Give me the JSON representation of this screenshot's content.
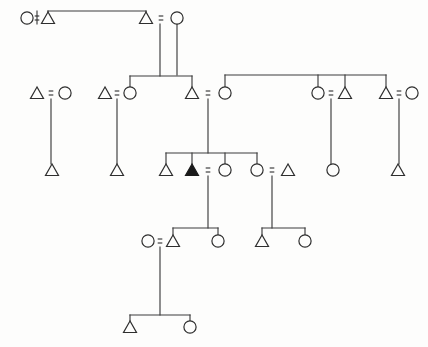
{
  "diagram": {
    "type": "kinship-genealogy-diagram",
    "background_color": "#fdfdfc",
    "line_color": "#3c3c3c",
    "symbol_stroke_color": "#2e2e2e",
    "ego_fill_color": "#1a1a1a",
    "width": 428,
    "height": 347,
    "legend": {
      "triangle": "male",
      "circle": "female",
      "filled_triangle": "ego",
      "equals_sign": "marriage-union",
      "vertical_line": "descent",
      "horizontal_line": "sibling-link"
    },
    "generation_rows": [
      {
        "id": "g1",
        "label": "Generation 1",
        "y": 18
      },
      {
        "id": "g2",
        "label": "Generation 2",
        "y": 93
      },
      {
        "id": "g3",
        "label": "Generation 3",
        "y": 170
      },
      {
        "id": "g4",
        "label": "Generation 4",
        "y": 241
      },
      {
        "id": "g5",
        "label": "Generation 5",
        "y": 327
      }
    ],
    "persons": [
      {
        "id": "p1",
        "sex": "female",
        "generation": 1,
        "x": 27,
        "y": 18,
        "ego": false
      },
      {
        "id": "p2",
        "sex": "male",
        "generation": 1,
        "x": 48,
        "y": 18,
        "ego": false
      },
      {
        "id": "p3",
        "sex": "male",
        "generation": 1,
        "x": 146,
        "y": 18,
        "ego": false
      },
      {
        "id": "p4",
        "sex": "female",
        "generation": 1,
        "x": 177,
        "y": 18,
        "ego": false
      },
      {
        "id": "p5",
        "sex": "male",
        "generation": 2,
        "x": 37,
        "y": 93,
        "ego": false
      },
      {
        "id": "p6",
        "sex": "female",
        "generation": 2,
        "x": 65,
        "y": 93,
        "ego": false
      },
      {
        "id": "p7",
        "sex": "male",
        "generation": 2,
        "x": 105,
        "y": 93,
        "ego": false
      },
      {
        "id": "p8",
        "sex": "female",
        "generation": 2,
        "x": 130,
        "y": 93,
        "ego": false
      },
      {
        "id": "p9",
        "sex": "male",
        "generation": 2,
        "x": 192,
        "y": 93,
        "ego": false
      },
      {
        "id": "p10",
        "sex": "female",
        "generation": 2,
        "x": 225,
        "y": 93,
        "ego": false
      },
      {
        "id": "p11",
        "sex": "female",
        "generation": 2,
        "x": 318,
        "y": 93,
        "ego": false
      },
      {
        "id": "p12",
        "sex": "male",
        "generation": 2,
        "x": 345,
        "y": 93,
        "ego": false
      },
      {
        "id": "p13",
        "sex": "male",
        "generation": 2,
        "x": 386,
        "y": 93,
        "ego": false
      },
      {
        "id": "p14",
        "sex": "female",
        "generation": 2,
        "x": 412,
        "y": 93,
        "ego": false
      },
      {
        "id": "p15",
        "sex": "male",
        "generation": 3,
        "x": 52,
        "y": 170,
        "ego": false
      },
      {
        "id": "p16",
        "sex": "male",
        "generation": 3,
        "x": 117,
        "y": 170,
        "ego": false
      },
      {
        "id": "p17",
        "sex": "male",
        "generation": 3,
        "x": 166,
        "y": 170,
        "ego": false
      },
      {
        "id": "p18",
        "sex": "male",
        "generation": 3,
        "x": 192,
        "y": 170,
        "ego": true
      },
      {
        "id": "p19",
        "sex": "female",
        "generation": 3,
        "x": 225,
        "y": 170,
        "ego": false
      },
      {
        "id": "p20",
        "sex": "female",
        "generation": 3,
        "x": 257,
        "y": 170,
        "ego": false
      },
      {
        "id": "p21",
        "sex": "male",
        "generation": 3,
        "x": 288,
        "y": 170,
        "ego": false
      },
      {
        "id": "p22",
        "sex": "female",
        "generation": 3,
        "x": 333,
        "y": 170,
        "ego": false
      },
      {
        "id": "p23",
        "sex": "male",
        "generation": 3,
        "x": 398,
        "y": 170,
        "ego": false
      },
      {
        "id": "p24",
        "sex": "female",
        "generation": 4,
        "x": 148,
        "y": 241,
        "ego": false
      },
      {
        "id": "p25",
        "sex": "male",
        "generation": 4,
        "x": 173,
        "y": 241,
        "ego": false
      },
      {
        "id": "p26",
        "sex": "female",
        "generation": 4,
        "x": 218,
        "y": 241,
        "ego": false
      },
      {
        "id": "p27",
        "sex": "male",
        "generation": 4,
        "x": 262,
        "y": 241,
        "ego": false
      },
      {
        "id": "p28",
        "sex": "female",
        "generation": 4,
        "x": 305,
        "y": 241,
        "ego": false
      },
      {
        "id": "p29",
        "sex": "male",
        "generation": 5,
        "x": 130,
        "y": 327,
        "ego": false
      },
      {
        "id": "p30",
        "sex": "female",
        "generation": 5,
        "x": 190,
        "y": 327,
        "ego": false
      }
    ],
    "unions": [
      {
        "id": "u1",
        "glyph": "=",
        "left": "p1",
        "right": "p2",
        "x": 37,
        "y": 18
      },
      {
        "id": "u2",
        "glyph": "=",
        "left": "p3",
        "right": "p4",
        "x": 161,
        "y": 18
      },
      {
        "id": "u3",
        "glyph": "=",
        "left": "p5",
        "right": "p6",
        "x": 51,
        "y": 93
      },
      {
        "id": "u4",
        "glyph": "=",
        "left": "p7",
        "right": "p8",
        "x": 117,
        "y": 93
      },
      {
        "id": "u5",
        "glyph": "=",
        "left": "p9",
        "right": "p10",
        "x": 208,
        "y": 93
      },
      {
        "id": "u6",
        "glyph": "=",
        "left": "p11",
        "right": "p12",
        "x": 331,
        "y": 93
      },
      {
        "id": "u7",
        "glyph": "=",
        "left": "p13",
        "right": "p14",
        "x": 399,
        "y": 93
      },
      {
        "id": "u8",
        "glyph": "=",
        "left": "p18",
        "right": "p19",
        "x": 208,
        "y": 170
      },
      {
        "id": "u9",
        "glyph": "=",
        "left": "p20",
        "right": "p21",
        "x": 272,
        "y": 170
      },
      {
        "id": "u10",
        "glyph": "=",
        "left": "p24",
        "right": "p25",
        "x": 160,
        "y": 241
      }
    ],
    "sibling_groups": [
      {
        "id": "s1",
        "bar_y": 11,
        "x_from": 48,
        "x_to": 146,
        "descent_x": 37,
        "descent_from_y": 18,
        "parents": "u1"
      },
      {
        "id": "s2",
        "bar_y": 76,
        "x_from": 130,
        "x_to": 192,
        "descent_x": 160,
        "descent_from_y": 18,
        "parents": "u1"
      },
      {
        "id": "s3",
        "bar_y": 75,
        "x_from": 225,
        "x_to": 386,
        "descent_x": 177,
        "descent_from_y": 18,
        "parents": "u2"
      },
      {
        "id": "s4",
        "bar_y": 153,
        "x_from": 166,
        "x_to": 257,
        "descent_x": 208,
        "descent_from_y": 93,
        "parents": "u5"
      },
      {
        "id": "s5",
        "bar_y": 228,
        "x_from": 173,
        "x_to": 218,
        "descent_x": 208,
        "descent_from_y": 170,
        "parents": "u8"
      },
      {
        "id": "s6",
        "bar_y": 228,
        "x_from": 262,
        "x_to": 305,
        "descent_x": 272,
        "descent_from_y": 170,
        "parents": "u9"
      },
      {
        "id": "s7",
        "bar_y": 315,
        "x_from": 130,
        "x_to": 190,
        "descent_x": 160,
        "descent_from_y": 241,
        "parents": "u10"
      }
    ],
    "single_descents": [
      {
        "id": "d1",
        "x": 51,
        "y_from": 93,
        "y_to": 170,
        "from": "u3",
        "to": "p15"
      },
      {
        "id": "d2",
        "x": 117,
        "y_from": 93,
        "y_to": 170,
        "from": "u4",
        "to": "p16"
      },
      {
        "id": "d3",
        "x": 331,
        "y_from": 93,
        "y_to": 170,
        "from": "u6",
        "to": "p22"
      },
      {
        "id": "d4",
        "x": 399,
        "y_from": 93,
        "y_to": 170,
        "from": "u7",
        "to": "p23"
      }
    ],
    "counts": {
      "total_persons": 30,
      "males": 16,
      "females": 14,
      "unions": 10,
      "generations": 5,
      "ego_count": 1
    }
  }
}
